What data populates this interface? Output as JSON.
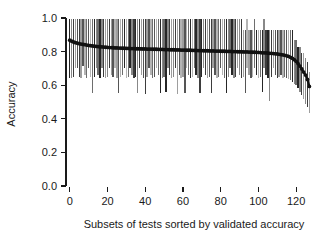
{
  "chart_data": {
    "type": "line",
    "title": "",
    "subtitle": "",
    "xlabel": "Subsets of tests sorted by validated accuracy",
    "ylabel": "Accuracy",
    "xlim": [
      -2,
      130
    ],
    "ylim": [
      0.0,
      1.0
    ],
    "xticks": [
      0,
      20,
      40,
      60,
      80,
      100,
      120
    ],
    "xticklabels": [
      "0",
      "20",
      "40",
      "60",
      "80",
      "100",
      "120"
    ],
    "yticks": [
      0.0,
      0.2,
      0.4,
      0.6,
      0.8,
      1.0
    ],
    "yticklabels": [
      "0.0",
      "0.2",
      "0.4",
      "0.6",
      "0.8",
      "1.0"
    ],
    "grid": false,
    "legend": null,
    "annotations": [],
    "series": [
      {
        "name": "Validated accuracy (point estimate)",
        "marker": "filled-circle",
        "color": "#111111",
        "x": [
          0,
          1,
          2,
          3,
          4,
          5,
          6,
          7,
          8,
          9,
          10,
          11,
          12,
          13,
          14,
          15,
          16,
          17,
          18,
          19,
          20,
          21,
          22,
          23,
          24,
          25,
          26,
          27,
          28,
          29,
          30,
          31,
          32,
          33,
          34,
          35,
          36,
          37,
          38,
          39,
          40,
          41,
          42,
          43,
          44,
          45,
          46,
          47,
          48,
          49,
          50,
          51,
          52,
          53,
          54,
          55,
          56,
          57,
          58,
          59,
          60,
          61,
          62,
          63,
          64,
          65,
          66,
          67,
          68,
          69,
          70,
          71,
          72,
          73,
          74,
          75,
          76,
          77,
          78,
          79,
          80,
          81,
          82,
          83,
          84,
          85,
          86,
          87,
          88,
          89,
          90,
          91,
          92,
          93,
          94,
          95,
          96,
          97,
          98,
          99,
          100,
          101,
          102,
          103,
          104,
          105,
          106,
          107,
          108,
          109,
          110,
          111,
          112,
          113,
          114,
          115,
          116,
          117,
          118,
          119,
          120,
          121,
          122,
          123,
          124,
          125,
          126,
          127
        ],
        "values": [
          0.868,
          0.862,
          0.857,
          0.853,
          0.85,
          0.847,
          0.845,
          0.843,
          0.841,
          0.839,
          0.837,
          0.835,
          0.834,
          0.832,
          0.831,
          0.83,
          0.829,
          0.828,
          0.827,
          0.826,
          0.825,
          0.824,
          0.824,
          0.823,
          0.822,
          0.822,
          0.821,
          0.821,
          0.82,
          0.82,
          0.819,
          0.819,
          0.818,
          0.818,
          0.818,
          0.817,
          0.817,
          0.817,
          0.816,
          0.816,
          0.816,
          0.815,
          0.815,
          0.815,
          0.814,
          0.814,
          0.814,
          0.813,
          0.813,
          0.813,
          0.812,
          0.812,
          0.812,
          0.811,
          0.811,
          0.811,
          0.81,
          0.81,
          0.81,
          0.809,
          0.809,
          0.809,
          0.808,
          0.808,
          0.808,
          0.807,
          0.807,
          0.807,
          0.806,
          0.806,
          0.806,
          0.805,
          0.805,
          0.805,
          0.804,
          0.804,
          0.804,
          0.803,
          0.803,
          0.803,
          0.802,
          0.802,
          0.802,
          0.801,
          0.801,
          0.801,
          0.8,
          0.8,
          0.8,
          0.799,
          0.799,
          0.799,
          0.798,
          0.798,
          0.798,
          0.797,
          0.797,
          0.796,
          0.796,
          0.795,
          0.795,
          0.794,
          0.793,
          0.793,
          0.792,
          0.791,
          0.79,
          0.789,
          0.788,
          0.787,
          0.786,
          0.784,
          0.782,
          0.78,
          0.778,
          0.775,
          0.771,
          0.766,
          0.76,
          0.752,
          0.742,
          0.729,
          0.714,
          0.697,
          0.678,
          0.66,
          0.634,
          0.593
        ]
      }
    ],
    "errorbars": {
      "name": "Confidence interval per subset",
      "color_range": [
        "#2b2b2b",
        "#a8a8a8"
      ],
      "lower": [
        0.64,
        0.645,
        0.648,
        0.7,
        0.705,
        0.648,
        0.642,
        0.712,
        0.66,
        0.645,
        0.7,
        0.65,
        0.552,
        0.648,
        0.705,
        0.66,
        0.645,
        0.7,
        0.65,
        0.645,
        0.648,
        0.705,
        0.66,
        0.648,
        0.7,
        0.645,
        0.552,
        0.648,
        0.66,
        0.705,
        0.645,
        0.648,
        0.7,
        0.66,
        0.645,
        0.648,
        0.552,
        0.705,
        0.66,
        0.645,
        0.548,
        0.648,
        0.7,
        0.66,
        0.645,
        0.648,
        0.705,
        0.66,
        0.552,
        0.645,
        0.648,
        0.56,
        0.7,
        0.66,
        0.645,
        0.648,
        0.705,
        0.548,
        0.66,
        0.645,
        0.648,
        0.552,
        0.7,
        0.66,
        0.645,
        0.648,
        0.705,
        0.66,
        0.645,
        0.555,
        0.648,
        0.7,
        0.66,
        0.645,
        0.648,
        0.552,
        0.705,
        0.66,
        0.645,
        0.648,
        0.7,
        0.66,
        0.645,
        0.556,
        0.648,
        0.705,
        0.66,
        0.645,
        0.648,
        0.7,
        0.66,
        0.645,
        0.648,
        0.552,
        0.705,
        0.66,
        0.645,
        0.648,
        0.7,
        0.66,
        0.645,
        0.648,
        0.56,
        0.705,
        0.66,
        0.645,
        0.505,
        0.648,
        0.7,
        0.66,
        0.645,
        0.648,
        0.66,
        0.645,
        0.648,
        0.64,
        0.635,
        0.63,
        0.62,
        0.61,
        0.6,
        0.585,
        0.56,
        0.54,
        0.515,
        0.49,
        0.47,
        0.435,
        0.43,
        0.365
      ],
      "upper": [
        0.995,
        0.995,
        0.995,
        0.995,
        0.995,
        0.995,
        0.995,
        0.995,
        0.995,
        0.995,
        0.995,
        0.995,
        0.995,
        0.995,
        0.995,
        0.995,
        0.995,
        0.995,
        0.995,
        0.995,
        0.995,
        0.995,
        0.995,
        0.995,
        0.995,
        0.995,
        0.995,
        0.995,
        0.995,
        0.995,
        0.995,
        0.995,
        0.995,
        0.995,
        0.995,
        0.995,
        0.995,
        0.995,
        0.995,
        0.995,
        0.995,
        0.995,
        0.995,
        0.995,
        0.995,
        0.995,
        0.995,
        0.995,
        0.995,
        0.995,
        0.995,
        0.995,
        0.995,
        0.995,
        0.995,
        0.995,
        0.995,
        0.995,
        0.995,
        0.995,
        0.995,
        0.995,
        0.995,
        0.995,
        0.995,
        0.995,
        0.995,
        0.995,
        0.995,
        0.995,
        0.995,
        0.995,
        0.995,
        0.995,
        0.995,
        0.995,
        0.995,
        0.995,
        0.995,
        0.995,
        0.995,
        0.995,
        0.995,
        0.995,
        0.995,
        0.995,
        0.995,
        0.995,
        0.995,
        0.995,
        0.995,
        0.995,
        0.93,
        0.93,
        0.995,
        0.93,
        0.93,
        0.93,
        0.995,
        0.93,
        0.93,
        0.93,
        0.93,
        0.995,
        0.93,
        0.93,
        0.93,
        0.93,
        0.93,
        0.93,
        0.93,
        0.93,
        0.93,
        0.93,
        0.93,
        0.93,
        0.93,
        0.93,
        0.93,
        0.87,
        0.87,
        0.825,
        0.825,
        0.79,
        0.79,
        0.76,
        0.74,
        0.68
      ]
    }
  }
}
